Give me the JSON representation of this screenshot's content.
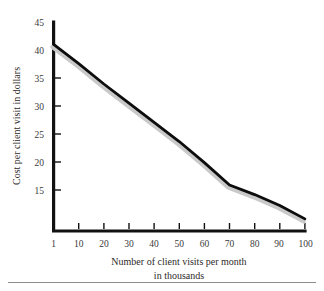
{
  "figure": {
    "name": "cost-per-client-visit-line-chart",
    "background_color": "#ffffff",
    "line_color": "#0d0d0d",
    "shadow_color": "#c9c9c9",
    "axis_color": "#111111",
    "rule_color": "#8d8d8d"
  },
  "chart_data": {
    "type": "line",
    "title": "",
    "subtitle": "",
    "xlabel": "Number of client visits per month in thousands",
    "xlabel_line1": "Number of client visits per month",
    "xlabel_line2": "in thousands",
    "ylabel": "Cost per client visit in dollars",
    "x": [
      1,
      10,
      20,
      30,
      40,
      50,
      60,
      70,
      80,
      90,
      100
    ],
    "values": [
      41.5,
      38.5,
      35.3,
      32.3,
      29.3,
      26.3,
      23.0,
      19.5,
      18.0,
      16.3,
      14.2
    ],
    "series": [
      {
        "name": "Cost per client visit",
        "values": [
          41.5,
          38.5,
          35.3,
          32.3,
          29.3,
          26.3,
          23.0,
          19.5,
          18.0,
          16.3,
          14.2
        ]
      }
    ],
    "xticks": [
      1,
      10,
      20,
      30,
      40,
      50,
      60,
      70,
      80,
      90,
      100
    ],
    "xtick_labels": [
      "1",
      "10",
      "20",
      "30",
      "40",
      "50",
      "60",
      "70",
      "80",
      "90",
      "100"
    ],
    "yticks": [
      15,
      20,
      25,
      30,
      35,
      40,
      45
    ],
    "ytick_labels": [
      "15",
      "20",
      "25",
      "30",
      "35",
      "40",
      "45"
    ],
    "xlim": [
      1,
      100
    ],
    "ylim": [
      12.3,
      45
    ],
    "grid": false,
    "legend": false,
    "legend_position": "none"
  },
  "ticks": {
    "x": {
      "t0": "1",
      "t1": "10",
      "t2": "20",
      "t3": "30",
      "t4": "40",
      "t5": "50",
      "t6": "60",
      "t7": "70",
      "t8": "80",
      "t9": "90",
      "t10": "100"
    },
    "y": {
      "t45": "45",
      "t40": "40",
      "t35": "35",
      "t30": "30",
      "t25": "25",
      "t20": "20",
      "t15": "15"
    }
  },
  "labels": {
    "y_axis_title": "Cost per client visit in dollars",
    "x_axis_title_line1": "Number of client visits per month",
    "x_axis_title_line2": "in thousands"
  }
}
